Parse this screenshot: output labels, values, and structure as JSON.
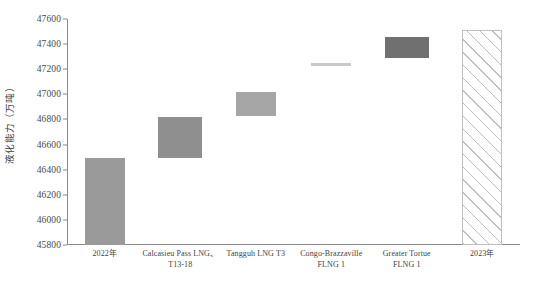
{
  "chart_data": {
    "type": "bar",
    "subtype": "waterfall",
    "title": "",
    "xlabel": "",
    "ylabel": "液化能力（万吨）",
    "ylim": [
      45800,
      47600
    ],
    "ytick_step": 200,
    "ytick_labels": [
      "47600",
      "47400",
      "47200",
      "47000",
      "46800",
      "46600",
      "46400",
      "46200",
      "46000",
      "45800"
    ],
    "yticks": [
      47600,
      47400,
      47200,
      47000,
      46800,
      46600,
      46400,
      46200,
      46000,
      45800
    ],
    "grid": false,
    "legend": "none",
    "categories": [
      "2022年",
      "Calcasieu Pass LNG、T13-18",
      "Tangguh LNG T3",
      "Congo-Brazzaville FLNG 1",
      "Greater Tortue FLNG 1",
      "2023年"
    ],
    "category_lines": [
      [
        "2022年"
      ],
      [
        "Calcasieu Pass LNG、",
        "T13-18"
      ],
      [
        "Tangguh LNG T3"
      ],
      [
        "Congo-Brazzaville",
        "FLNG 1"
      ],
      [
        "Greater Tortue",
        "FLNG 1"
      ],
      [
        "2023年"
      ]
    ],
    "bars": [
      {
        "label": "2022年",
        "base": 45800,
        "top": 46490,
        "value": 690,
        "kind": "total",
        "color": "#9a9a9a"
      },
      {
        "label": "Calcasieu Pass LNG、T13-18",
        "base": 46490,
        "top": 46820,
        "value": 330,
        "kind": "increment",
        "color": "#8f8f8f"
      },
      {
        "label": "Tangguh LNG T3",
        "base": 46830,
        "top": 47020,
        "value": 190,
        "kind": "increment",
        "color": "#a6a6a6"
      },
      {
        "label": "Congo-Brazzaville FLNG 1",
        "base": 47225,
        "top": 47250,
        "value": 25,
        "kind": "increment",
        "color": "#c9c9c9"
      },
      {
        "label": "Greater Tortue FLNG 1",
        "base": 47290,
        "top": 47460,
        "value": 170,
        "kind": "increment",
        "color": "#707070"
      },
      {
        "label": "2023年",
        "base": 45800,
        "top": 47510,
        "value": 1710,
        "kind": "total-hatch",
        "color": "#ffffff"
      }
    ],
    "hatch_color": "#bfbfbf",
    "axis_color": "#8a8a8a"
  }
}
